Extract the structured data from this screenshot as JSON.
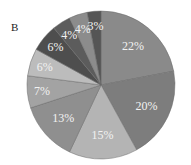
{
  "panel_label": "B",
  "chart_data": {
    "type": "pie",
    "title": "",
    "panel": "B",
    "start_angle": "12 o'clock",
    "direction": "clockwise",
    "categories": [
      "Slice 1",
      "Slice 2",
      "Slice 3",
      "Slice 4",
      "Slice 5",
      "Slice 6",
      "Slice 7",
      "Slice 8",
      "Slice 9",
      "Slice 10"
    ],
    "values": [
      22,
      20,
      15,
      13,
      7,
      6,
      6,
      4,
      4,
      3
    ],
    "labels": [
      "22%",
      "20%",
      "15%",
      "13%",
      "7%",
      "6%",
      "6%",
      "4%",
      "4%",
      "3%"
    ],
    "colors": [
      "#8a8a8a",
      "#7d7d7d",
      "#b4b4b4",
      "#8f8f8f",
      "#a3a3a3",
      "#bcbcbc",
      "#4e4e4e",
      "#5c5c5c",
      "#8c8c8c",
      "#555555"
    ],
    "legend": "none",
    "center": [
      101,
      85
    ],
    "radius": 74
  }
}
